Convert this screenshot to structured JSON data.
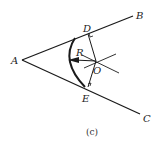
{
  "diagram": {
    "caption": "(c)",
    "labels": {
      "A": "A",
      "B": "B",
      "C": "C",
      "D": "D",
      "E": "E",
      "O": "O",
      "R": "R"
    },
    "colors": {
      "line": "#1a1a1a",
      "background": "#ffffff"
    },
    "points": {
      "A": [
        22,
        60
      ],
      "B_end": [
        133,
        17
      ],
      "C_end": [
        140,
        115
      ],
      "D": [
        87,
        34
      ],
      "E": [
        87,
        87
      ],
      "O": [
        96,
        61
      ],
      "arc_leftmost": [
        68,
        60
      ]
    }
  }
}
